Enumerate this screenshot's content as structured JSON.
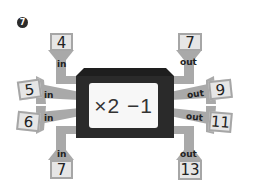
{
  "problem": {
    "number": "7"
  },
  "machine": {
    "rule": "×2 −1"
  },
  "inputs": [
    {
      "value": "4",
      "label": "in",
      "position": "top-left"
    },
    {
      "value": "5",
      "label": "in",
      "position": "left-upper"
    },
    {
      "value": "6",
      "label": "in",
      "position": "left-lower"
    },
    {
      "value": "7",
      "label": "in",
      "position": "bottom-left"
    }
  ],
  "outputs": [
    {
      "value": "7",
      "label": "out",
      "position": "top-right"
    },
    {
      "value": "9",
      "label": "out",
      "position": "right-upper"
    },
    {
      "value": "11",
      "label": "out",
      "position": "right-lower"
    },
    {
      "value": "13",
      "label": "out",
      "position": "bottom-right"
    }
  ],
  "colors": {
    "arrow": "#a9a9a9",
    "box_fill": "#e6e6e6",
    "box_border": "#a6a6a6",
    "machine_body": "#2a2a2a",
    "machine_window": "#f7f7f7"
  }
}
